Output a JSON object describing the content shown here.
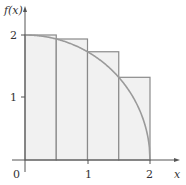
{
  "chart_data": {
    "type": "area",
    "title": "",
    "xlabel": "x",
    "ylabel": "f(x)",
    "xlim": [
      0,
      2
    ],
    "ylim": [
      0,
      2
    ],
    "x_ticks": [
      "0",
      "1",
      "2"
    ],
    "y_ticks": [
      "1",
      "2"
    ],
    "origin_label": "0",
    "grid": false,
    "legend": null,
    "curve": {
      "function": "sqrt(4 - x^2)",
      "x": [
        0,
        0.25,
        0.5,
        0.75,
        1.0,
        1.25,
        1.5,
        1.75,
        1.9,
        2.0
      ],
      "y": [
        2.0,
        1.984,
        1.936,
        1.854,
        1.732,
        1.561,
        1.323,
        0.968,
        0.624,
        0.0
      ]
    },
    "rectangles": [
      {
        "x_start": 0.0,
        "x_end": 0.5,
        "height": 2.0
      },
      {
        "x_start": 0.5,
        "x_end": 1.0,
        "height": 1.936
      },
      {
        "x_start": 1.0,
        "x_end": 1.5,
        "height": 1.732
      },
      {
        "x_start": 1.5,
        "x_end": 2.0,
        "height": 1.323
      }
    ]
  },
  "labels": {
    "y_axis": "f(x)",
    "x_axis": "x",
    "origin": "0",
    "x_tick_1": "1",
    "x_tick_2": "2",
    "y_tick_1": "1",
    "y_tick_2": "2"
  },
  "colors": {
    "fill": "#f1f1f1",
    "rect_stroke": "#8a8a8a",
    "curve": "#9a9a9a",
    "axis": "#555555"
  }
}
